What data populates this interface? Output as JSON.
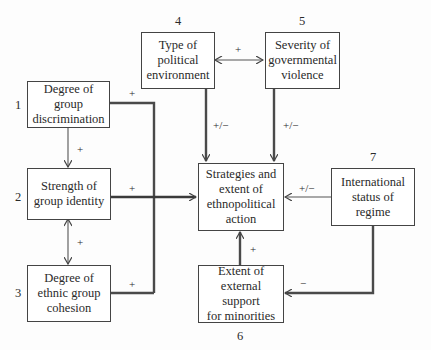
{
  "diagram": {
    "nodes": [
      {
        "id": "1",
        "number": "1",
        "label": "Degree of group\ndiscrimination"
      },
      {
        "id": "2",
        "number": "2",
        "label": "Strength of\ngroup identity"
      },
      {
        "id": "3",
        "number": "3",
        "label": "Degree of\nethnic group\ncohesion"
      },
      {
        "id": "4",
        "number": "4",
        "label": "Type of\npolitical\nenvironment"
      },
      {
        "id": "5",
        "number": "5",
        "label": "Severity of\ngovernmental\nviolence"
      },
      {
        "id": "6",
        "number": "6",
        "label": "Extent of\nexternal support\nfor minorities"
      },
      {
        "id": "7",
        "number": "7",
        "label": "International\nstatus of\nregime"
      },
      {
        "id": "center",
        "label": "Strategies and\nextent of\nethnopolitical\naction"
      }
    ],
    "edges": [
      {
        "from": "1",
        "to": "center",
        "sign": "+",
        "style": "thick"
      },
      {
        "from": "1",
        "to": "2",
        "sign": "+",
        "style": "thin"
      },
      {
        "from": "2",
        "to": "center",
        "sign": "+",
        "style": "thick"
      },
      {
        "from": "2",
        "to": "3",
        "sign": "+",
        "style": "thin",
        "bidirectional": true
      },
      {
        "from": "3",
        "to": "center",
        "sign": "+",
        "style": "thick"
      },
      {
        "from": "4",
        "to": "5",
        "sign": "+",
        "style": "thin",
        "bidirectional": true
      },
      {
        "from": "4",
        "to": "center",
        "sign": "+/−",
        "style": "thick"
      },
      {
        "from": "5",
        "to": "center",
        "sign": "+/−",
        "style": "thick"
      },
      {
        "from": "7",
        "to": "center",
        "sign": "+/−",
        "style": "thin"
      },
      {
        "from": "7",
        "to": "6",
        "sign": "−",
        "style": "thick"
      },
      {
        "from": "6",
        "to": "center",
        "sign": "+",
        "style": "thick"
      }
    ]
  },
  "colors": {
    "line": "#4a4a4a",
    "box_border": "#444444",
    "text": "#2a2a2a"
  }
}
